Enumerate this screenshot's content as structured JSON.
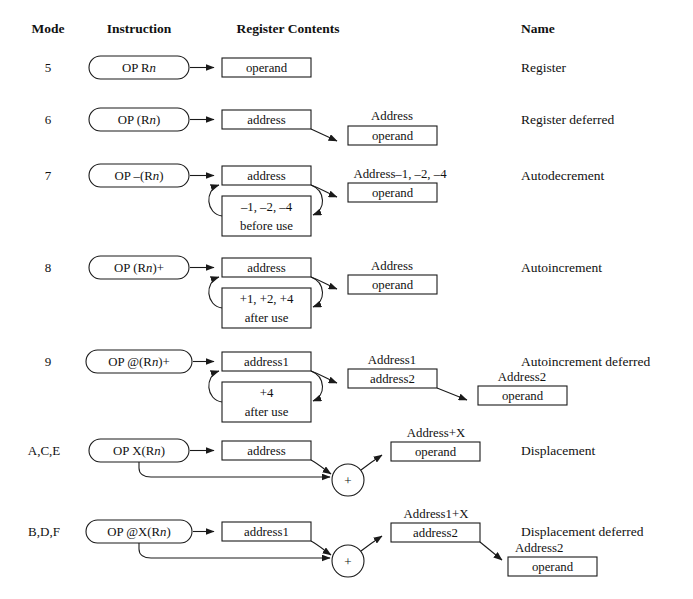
{
  "figure": {
    "background_color": "#ffffff",
    "line_color": "#1a1a1a",
    "text_color": "#111111"
  },
  "headers": {
    "mode": "Mode",
    "instruction": "Instruction",
    "register_contents": "Register Contents",
    "name": "Name"
  },
  "rows": [
    {
      "mode": "5",
      "instruction": "OP R",
      "instruction_italic": "n",
      "instruction_suffix": "",
      "name": "Register",
      "register_box": "operand",
      "caption": ""
    },
    {
      "mode": "6",
      "instruction": "OP (R",
      "instruction_italic": "n",
      "instruction_suffix": ")",
      "name": "Register deferred",
      "register_box": "address",
      "target_caption": "Address",
      "target_box": "operand"
    },
    {
      "mode": "7",
      "instruction": "OP –(R",
      "instruction_italic": "n",
      "instruction_suffix": ")",
      "name": "Autodecrement",
      "register_box": "address",
      "modifier_line1": "–1, –2, –4",
      "modifier_line2": "before use",
      "target_caption": "Address–1, –2, –4",
      "target_box": "operand"
    },
    {
      "mode": "8",
      "instruction": "OP (R",
      "instruction_italic": "n",
      "instruction_suffix": ")+",
      "name": "Autoincrement",
      "register_box": "address",
      "modifier_line1": "+1, +2, +4",
      "modifier_line2": "after use",
      "target_caption": "Address",
      "target_box": "operand"
    },
    {
      "mode": "9",
      "instruction": "OP @(R",
      "instruction_italic": "n",
      "instruction_suffix": ")+",
      "name": "Autoincrement deferred",
      "register_box": "address1",
      "modifier_line1": "+4",
      "modifier_line2": "after use",
      "target_caption": "Address1",
      "target_box": "address2",
      "final_caption": "Address2",
      "final_box": "operand"
    },
    {
      "mode": "A,C,E",
      "instruction": "OP X(R",
      "instruction_italic": "n",
      "instruction_suffix": ")",
      "name": "Displacement",
      "register_box": "address",
      "adder": "+",
      "target_caption": "Address+X",
      "target_box": "operand"
    },
    {
      "mode": "B,D,F",
      "instruction": "OP @X(R",
      "instruction_italic": "n",
      "instruction_suffix": ")",
      "name": "Displacement deferred",
      "register_box": "address1",
      "adder": "+",
      "target_caption": "Address1+X",
      "target_box": "address2",
      "final_caption": "Address2",
      "final_box": "operand"
    }
  ]
}
